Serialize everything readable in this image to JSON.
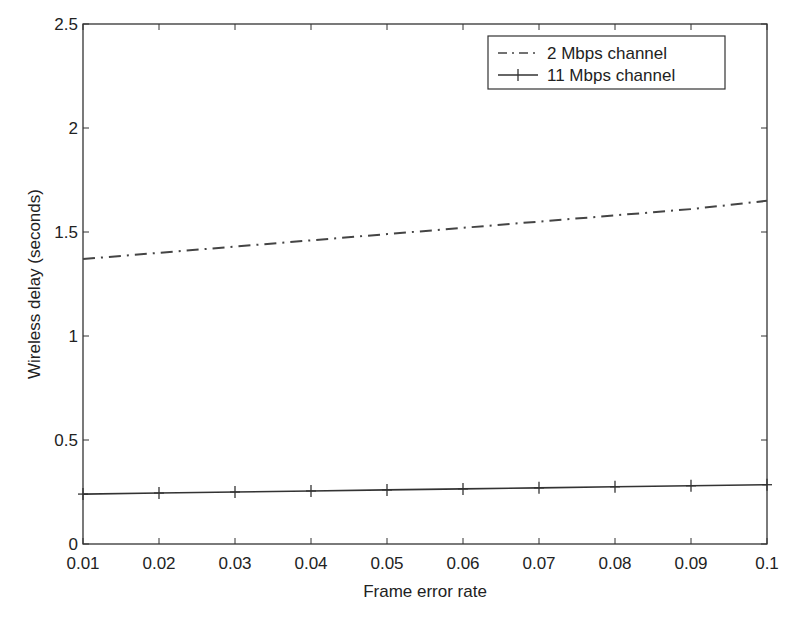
{
  "chart_data": {
    "type": "line",
    "title": "",
    "xlabel": "Frame error rate",
    "ylabel": "Wireless delay (seconds)",
    "xlim": [
      0.01,
      0.1
    ],
    "ylim": [
      0,
      2.5
    ],
    "x_ticks": [
      "0.01",
      "0.02",
      "0.03",
      "0.04",
      "0.05",
      "0.06",
      "0.07",
      "0.08",
      "0.09",
      "0.1"
    ],
    "y_ticks": [
      "0",
      "0.5",
      "1",
      "1.5",
      "2",
      "2.5"
    ],
    "grid": false,
    "legend_position": "upper right",
    "x": [
      0.01,
      0.02,
      0.03,
      0.04,
      0.05,
      0.06,
      0.07,
      0.08,
      0.09,
      0.1
    ],
    "series": [
      {
        "name": "2 Mbps channel",
        "style": "dash-dot",
        "values": [
          1.37,
          1.4,
          1.43,
          1.46,
          1.49,
          1.52,
          1.55,
          1.58,
          1.61,
          1.65
        ]
      },
      {
        "name": "11 Mbps channel",
        "style": "solid with + markers",
        "values": [
          0.24,
          0.245,
          0.25,
          0.255,
          0.26,
          0.265,
          0.27,
          0.275,
          0.28,
          0.285
        ]
      }
    ]
  }
}
